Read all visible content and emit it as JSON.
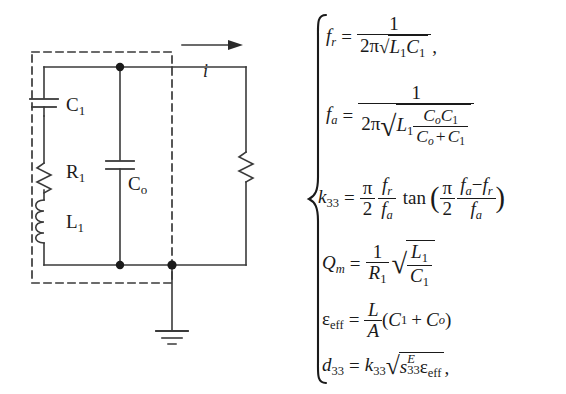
{
  "figure": {
    "type": "piezoelectric-equivalent-circuit-with-formulas",
    "circuit": {
      "dashed_box_label": "resonator-model-boundary",
      "components": [
        {
          "name": "C1",
          "label": "C",
          "sub": "1",
          "kind": "capacitor",
          "branch": "motional"
        },
        {
          "name": "R1",
          "label": "R",
          "sub": "1",
          "kind": "resistor",
          "branch": "motional"
        },
        {
          "name": "L1",
          "label": "L",
          "sub": "1",
          "kind": "inductor",
          "branch": "motional"
        },
        {
          "name": "Co",
          "label": "C",
          "sub": "o",
          "kind": "capacitor",
          "branch": "static"
        },
        {
          "name": "RL",
          "label": "",
          "sub": "",
          "kind": "resistor",
          "branch": "load"
        }
      ],
      "current_label": "i",
      "ground_label": "ground",
      "arrow_direction": "right"
    },
    "equations": [
      {
        "id": "fr",
        "lhs_var": "f",
        "lhs_sub": "r",
        "text": "f_r = 1 / (2π sqrt(L_1 C_1),"
      },
      {
        "id": "fa",
        "lhs_var": "f",
        "lhs_sub": "a",
        "text": "f_a = 1 / (2π sqrt(L_1 (C_o C_1)/(C_o + C_1)))"
      },
      {
        "id": "k33",
        "lhs_var": "k",
        "lhs_sub": "33",
        "text": "k_33 = (π/2)(f_r/f_a) tan((π/2)(f_a - f_r)/f_a)"
      },
      {
        "id": "Qm",
        "lhs_var": "Q",
        "lhs_sub": "m",
        "text": "Q_m = (1/R_1) sqrt(L_1/C_1)"
      },
      {
        "id": "epseff",
        "lhs_var": "ε",
        "lhs_sub": "eff",
        "text": "ε_eff = (L/A)(C_1 + C_o)"
      },
      {
        "id": "d33",
        "lhs_var": "d",
        "lhs_sub": "33",
        "text": "d_33 = k_33 sqrt(s^E_33 ε_eff),"
      }
    ],
    "symbols": {
      "one": "1",
      "two": "2",
      "twopi": "2π",
      "pi": "π",
      "equals": "=",
      "plus": "+",
      "minus": "−",
      "comma": ",",
      "tan": "tan",
      "paren_open": "(",
      "paren_close": ")",
      "radical": "√",
      "C": "C",
      "L": "L",
      "A": "A",
      "R": "R",
      "f": "f",
      "k": "k",
      "Q": "Q",
      "d": "d",
      "s": "s",
      "E": "E",
      "eps": "ε",
      "eff": "eff",
      "sub_1": "1",
      "sub_o": "o",
      "sub_r": "r",
      "sub_a": "a",
      "sub_m": "m",
      "sub_33": "33",
      "brace": "{"
    },
    "colors": {
      "ink": "#1a1a1a",
      "background": "#ffffff"
    }
  }
}
